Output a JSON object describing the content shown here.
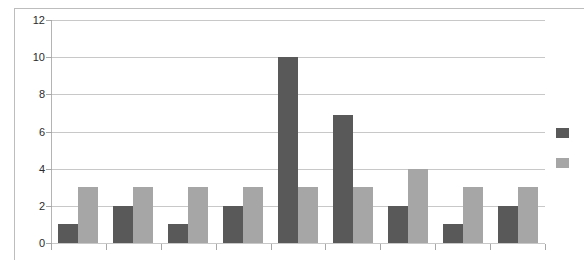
{
  "chart_data": {
    "type": "bar",
    "title": "",
    "xlabel": "",
    "ylabel": "",
    "ylim": [
      0,
      12
    ],
    "yticks": [
      0,
      2,
      4,
      6,
      8,
      10,
      12
    ],
    "ytick_labels": [
      "0",
      "2",
      "4",
      "6",
      "8",
      "10",
      "12"
    ],
    "xtick_labels": [
      "",
      "",
      "",
      "",
      "",
      "",
      "",
      "",
      ""
    ],
    "categories": [
      "1",
      "2",
      "3",
      "4",
      "5",
      "6",
      "7",
      "8",
      "9"
    ],
    "grid": true,
    "legend_position": "right",
    "series": [
      {
        "name": "",
        "color": "#595959",
        "values": [
          1,
          2,
          1,
          2,
          10,
          6.9,
          2,
          1,
          2
        ]
      },
      {
        "name": "",
        "color": "#a6a6a6",
        "values": [
          3,
          3,
          3,
          3,
          3,
          3,
          4,
          3,
          3
        ]
      }
    ]
  },
  "axis": {
    "y_max_label": "12",
    "y_min_label": "0"
  },
  "legend": {
    "entries": [
      {
        "label": "",
        "color": "#595959",
        "swatch_name": "legend-swatch-series-1"
      },
      {
        "label": "",
        "color": "#a6a6a6",
        "swatch_name": "legend-swatch-series-2"
      }
    ]
  },
  "colors": {
    "series_dark": "#595959",
    "series_light": "#a6a6a6",
    "gridline": "#c8c8c8",
    "axis": "#9a9a9a",
    "background": "#ffffff",
    "text": "#2b2b2b"
  }
}
